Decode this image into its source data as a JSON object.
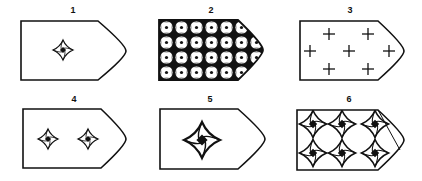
{
  "figure": {
    "panels": [
      {
        "label": "1",
        "pattern": "single-star",
        "description": "one small four-pointed star centered"
      },
      {
        "label": "2",
        "pattern": "dense-grid",
        "description": "dense grid of circles with dots (7x4)"
      },
      {
        "label": "3",
        "pattern": "crosses",
        "description": "seven plus-sign crosses"
      },
      {
        "label": "4",
        "pattern": "two-stars",
        "description": "two small four-pointed stars side by side"
      },
      {
        "label": "5",
        "pattern": "single-large-star",
        "description": "one larger four-pointed star centered"
      },
      {
        "label": "6",
        "pattern": "six-stars",
        "description": "six four-pointed stars in 3x2 grid"
      }
    ],
    "colors": {
      "stroke": "#111111",
      "background": "#ffffff"
    }
  }
}
